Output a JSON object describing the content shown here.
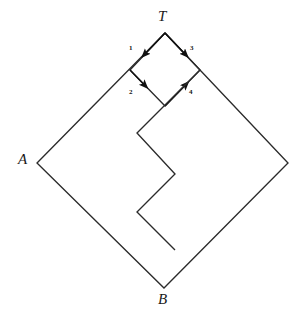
{
  "figure": {
    "name": "directed-diamond-staircase-diagram",
    "background_color": "#ffffff",
    "stroke_color": "#2b2b2b",
    "label_color": "#1a1a1a"
  },
  "vertex_labels": {
    "top": "T",
    "left": "A",
    "bottom": "B"
  },
  "edge_labels": {
    "e1": "1",
    "e2": "2",
    "e3": "3",
    "e4": "4"
  },
  "diagram_data": {
    "type": "diagram",
    "outer_diamond": {
      "points": [
        {
          "label": "T",
          "x": 165,
          "y": 33
        },
        {
          "label": "right",
          "x": 288,
          "y": 163
        },
        {
          "label": "B",
          "x": 164,
          "y": 288
        },
        {
          "label": "A",
          "x": 37,
          "y": 163
        }
      ]
    },
    "inner_diamond": {
      "points": [
        {
          "label": "T",
          "x": 165,
          "y": 33
        },
        {
          "label": "inner-right",
          "x": 200,
          "y": 70
        },
        {
          "label": "inner-bottom",
          "x": 165,
          "y": 106
        },
        {
          "label": "inner-left",
          "x": 130,
          "y": 70
        }
      ]
    },
    "directed_edges": [
      {
        "id": "1",
        "from": "T",
        "to": "inner-left",
        "label": "1",
        "label_x": 129,
        "label_y": 47
      },
      {
        "id": "2",
        "from": "inner-left",
        "to": "inner-bottom",
        "label": "2",
        "label_x": 129,
        "label_y": 92
      },
      {
        "id": "3",
        "from": "T",
        "to": "inner-right",
        "label": "3",
        "label_x": 190,
        "label_y": 47
      },
      {
        "id": "4",
        "from": "inner-bottom",
        "to": "inner-right",
        "label": "4",
        "label_x": 189,
        "label_y": 92
      }
    ],
    "staircase_path": [
      {
        "x": 200,
        "y": 70
      },
      {
        "x": 137,
        "y": 133
      },
      {
        "x": 137,
        "y": 135
      },
      {
        "x": 175,
        "y": 174
      },
      {
        "x": 137,
        "y": 212
      },
      {
        "x": 175,
        "y": 250
      }
    ],
    "notes": "Large outer diamond A-T-right-B with an inner diamond at top sharing vertex T; four arrowed edges numbered 1-4; a zigzag staircase polyline descends from inner-right vertex into the interior and terminates freely."
  }
}
